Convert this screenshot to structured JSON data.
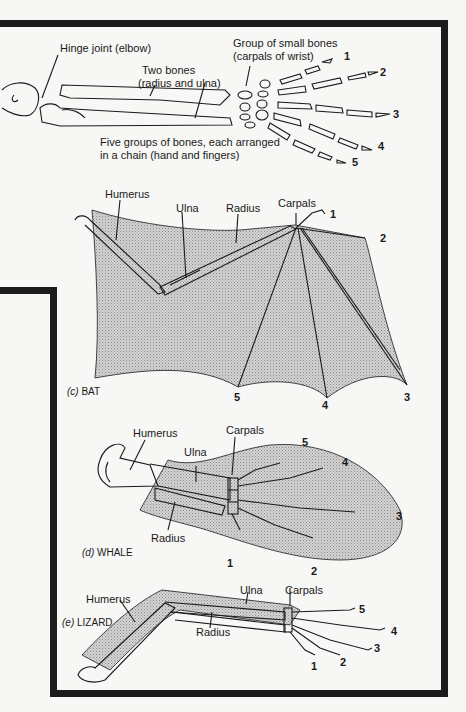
{
  "figure": {
    "panel_top": {
      "labels": {
        "hinge": "Hinge joint (elbow)",
        "two_bones_1": "Two bones",
        "two_bones_2": "(radius and ulna)",
        "carpals_1": "Group of small bones",
        "carpals_2": "(carpals of wrist)",
        "five_groups_1": "Five groups of bones, each arranged",
        "five_groups_2": "in a  chain  (hand and fingers)"
      },
      "digits": [
        "1",
        "2",
        "3",
        "4",
        "5"
      ]
    },
    "bat": {
      "caption_letter": "(c)",
      "caption_name": "BAT",
      "labels": {
        "humerus": "Humerus",
        "ulna": "Ulna",
        "radius": "Radius",
        "carpals": "Carpals"
      },
      "digits": [
        "1",
        "2",
        "3",
        "4",
        "5"
      ]
    },
    "whale": {
      "caption_letter": "(d)",
      "caption_name": "WHALE",
      "labels": {
        "humerus": "Humerus",
        "ulna": "Ulna",
        "radius": "Radius",
        "carpals": "Carpals"
      },
      "digits": [
        "1",
        "2",
        "3",
        "4",
        "5"
      ]
    },
    "lizard": {
      "caption_letter": "(e)",
      "caption_name": "LIZARD",
      "labels": {
        "humerus": "Humerus",
        "ulna": "Ulna",
        "radius": "Radius",
        "carpals": "Carpals"
      },
      "digits": [
        "1",
        "2",
        "3",
        "4",
        "5"
      ]
    },
    "colors": {
      "frame": "#1c1c1c",
      "stipple": "#b8b8b8",
      "line": "#1a1a1a",
      "paper": "#f7f7f5"
    }
  }
}
